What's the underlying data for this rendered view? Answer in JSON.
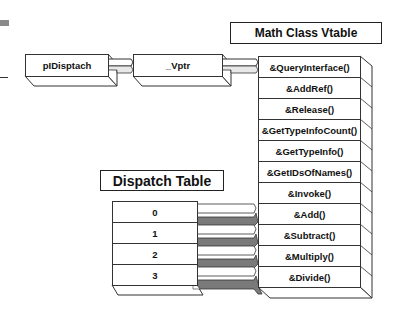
{
  "diagram": {
    "pointer_chain": [
      {
        "label": "pIDisptach"
      },
      {
        "label": "_Vptr"
      }
    ],
    "vtable": {
      "title": "Math Class Vtable",
      "entries": [
        {
          "label": "&QueryInterface()"
        },
        {
          "label": "&AddRef()"
        },
        {
          "label": "&Release()"
        },
        {
          "label": "&GetTypeInfoCount()"
        },
        {
          "label": "&GetTypeInfo()"
        },
        {
          "label": "&GetIDsOfNames()"
        },
        {
          "label": "&Invoke()"
        },
        {
          "label": "&Add()"
        },
        {
          "label": "&Subtract()"
        },
        {
          "label": "&Multiply()"
        },
        {
          "label": "&Divide()"
        }
      ]
    },
    "dispatch_table": {
      "title": "Dispatch Table",
      "entries": [
        {
          "label": "0",
          "maps_to": "&Add()"
        },
        {
          "label": "1",
          "maps_to": "&Subtract()"
        },
        {
          "label": "2",
          "maps_to": "&Multiply()"
        },
        {
          "label": "3",
          "maps_to": "&Divide()"
        }
      ]
    },
    "colors": {
      "line": "#333333",
      "arrow_shadow": "#7a7a7a",
      "background": "#ffffff"
    }
  }
}
